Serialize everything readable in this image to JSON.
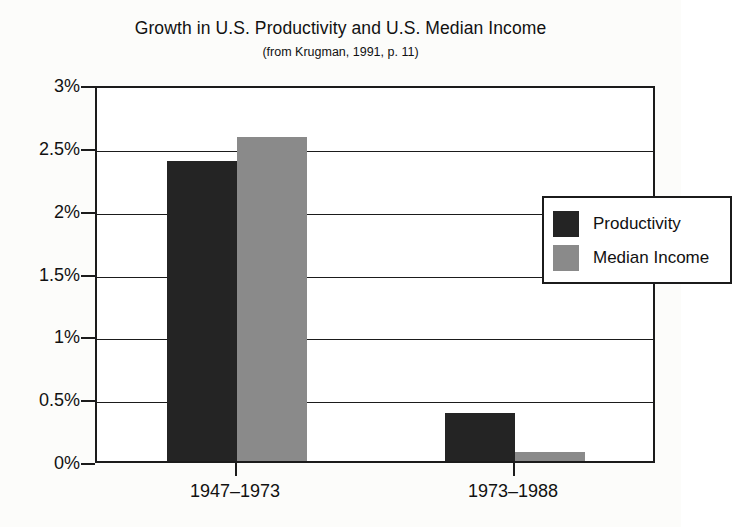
{
  "chart_data": {
    "type": "bar",
    "title": "Growth in U.S. Productivity and U.S. Median Income",
    "subtitle": "(from Krugman, 1991, p. 11)",
    "xlabel": "",
    "ylabel": "",
    "categories": [
      "1947–1973",
      "1973–1988"
    ],
    "series": [
      {
        "name": "Productivity",
        "values": [
          2.39,
          0.38
        ],
        "color": "#242424"
      },
      {
        "name": "Median Income",
        "values": [
          2.58,
          0.07
        ],
        "color": "#8a8a8a"
      }
    ],
    "ylim": [
      0,
      3
    ],
    "ytick_values": [
      3,
      2.5,
      2,
      1.5,
      1,
      0.5,
      0
    ],
    "ytick_labels": [
      "3%",
      "2.5%",
      "2%",
      "1.5%",
      "1%",
      "0.5%",
      "0%"
    ],
    "grid": true,
    "legend_position": "upper right",
    "units": "percent per year"
  },
  "legend": {
    "items": [
      {
        "label": "Productivity",
        "swatch": "productivity-swatch"
      },
      {
        "label": "Median Income",
        "swatch": "median-income-swatch"
      }
    ]
  },
  "axes": {
    "y_labels": [
      "3%",
      "2.5%",
      "2%",
      "1.5%",
      "1%",
      "0.5%",
      "0%"
    ],
    "x_labels": [
      "1947–1973",
      "1973–1988"
    ]
  },
  "colors": {
    "productivity": "#242424",
    "median_income": "#8a8a8a",
    "axis": "#1b1b1b",
    "background": "#fcfcfa"
  }
}
